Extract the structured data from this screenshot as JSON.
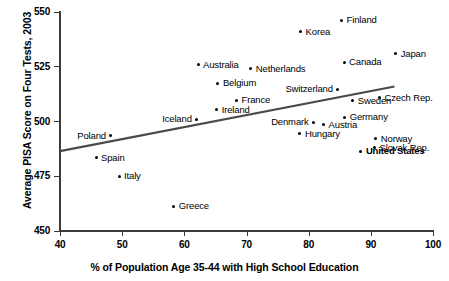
{
  "chart_data": {
    "type": "scatter",
    "title": "",
    "xlabel": "% of Population Age 35-44 with High School Education",
    "ylabel": "Average PISA Score on Four Tests, 2003",
    "xlim": [
      40,
      100
    ],
    "ylim": [
      450,
      550
    ],
    "xticks": [
      "40",
      "50",
      "60",
      "70",
      "80",
      "90",
      "100"
    ],
    "yticks": [
      "550",
      "525",
      "500",
      "475",
      "450"
    ],
    "grid": false,
    "legend": null,
    "points": [
      {
        "label": "Finland",
        "x": 85.3,
        "y": 546.2,
        "label_pos": "right"
      },
      {
        "label": "Korea",
        "x": 78.7,
        "y": 540.9,
        "label_pos": "right"
      },
      {
        "label": "Japan",
        "x": 94.0,
        "y": 531.0,
        "label_pos": "right"
      },
      {
        "label": "Canada",
        "x": 85.7,
        "y": 527.0,
        "label_pos": "right"
      },
      {
        "label": "Australia",
        "x": 62.2,
        "y": 526.0,
        "label_pos": "right"
      },
      {
        "label": "Netherlands",
        "x": 70.7,
        "y": 524.0,
        "label_pos": "right"
      },
      {
        "label": "Belgium",
        "x": 65.4,
        "y": 517.5,
        "label_pos": "right"
      },
      {
        "label": "Switzerland",
        "x": 84.7,
        "y": 514.8,
        "label_pos": "left"
      },
      {
        "label": "Czech Rep.",
        "x": 91.4,
        "y": 510.8,
        "label_pos": "right"
      },
      {
        "label": "France",
        "x": 68.4,
        "y": 509.8,
        "label_pos": "right"
      },
      {
        "label": "Sweden",
        "x": 87.1,
        "y": 509.4,
        "label_pos": "right"
      },
      {
        "label": "Ireland",
        "x": 65.2,
        "y": 505.3,
        "label_pos": "right"
      },
      {
        "label": "Germany",
        "x": 85.8,
        "y": 502.0,
        "label_pos": "right"
      },
      {
        "label": "Iceland",
        "x": 62.0,
        "y": 501.1,
        "label_pos": "left"
      },
      {
        "label": "Denmark",
        "x": 80.8,
        "y": 499.6,
        "label_pos": "left"
      },
      {
        "label": "Austria",
        "x": 82.4,
        "y": 498.6,
        "label_pos": "right"
      },
      {
        "label": "Hungary",
        "x": 78.6,
        "y": 494.3,
        "label_pos": "right"
      },
      {
        "label": "Poland",
        "x": 48.2,
        "y": 493.4,
        "label_pos": "left"
      },
      {
        "label": "Norway",
        "x": 90.8,
        "y": 492.2,
        "label_pos": "right"
      },
      {
        "label": "Slovak Rep.",
        "x": 90.6,
        "y": 488.0,
        "label_pos": "right"
      },
      {
        "label": "United States",
        "x": 88.4,
        "y": 486.5,
        "label_pos": "right",
        "bold": true
      },
      {
        "label": "Spain",
        "x": 45.8,
        "y": 483.5,
        "label_pos": "right"
      },
      {
        "label": "Italy",
        "x": 49.5,
        "y": 474.9,
        "label_pos": "right"
      },
      {
        "label": "Greece",
        "x": 58.3,
        "y": 461.4,
        "label_pos": "right"
      }
    ],
    "trendline": {
      "type": "linear",
      "x_start": 40.0,
      "y_start": 486.5,
      "x_end": 93.8,
      "y_end": 516.0,
      "color": "#4a4a4a",
      "width": 2.2
    }
  },
  "style": {
    "axis_color": "#3a3a3a",
    "point_color": "#000000",
    "background": "#ffffff"
  }
}
